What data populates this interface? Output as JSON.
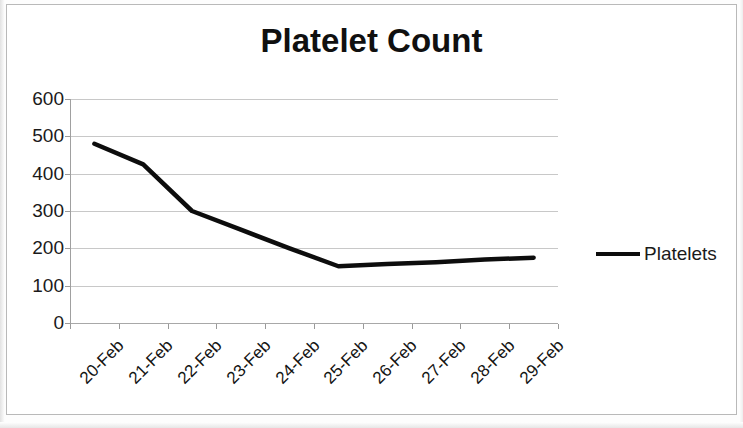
{
  "chart_data": {
    "type": "line",
    "title": "Platelet Count",
    "xlabel": "",
    "ylabel": "",
    "categories": [
      "20-Feb",
      "21-Feb",
      "22-Feb",
      "23-Feb",
      "24-Feb",
      "25-Feb",
      "26-Feb",
      "27-Feb",
      "28-Feb",
      "29-Feb"
    ],
    "series": [
      {
        "name": "Platelets",
        "values": [
          480,
          425,
          300,
          250,
          200,
          152,
          158,
          163,
          170,
          175
        ],
        "color": "#0d0d0d"
      }
    ],
    "ylim": [
      0,
      600
    ],
    "y_ticks": [
      0,
      100,
      200,
      300,
      400,
      500,
      600
    ],
    "y_tick_labels": [
      "0",
      "100",
      "200",
      "300",
      "400",
      "500",
      "600"
    ],
    "grid": true,
    "legend_position": "right",
    "x_tick_label_rotation": -45
  },
  "legend": {
    "entries": [
      {
        "label": "Platelets",
        "swatch": "line-swatch"
      }
    ]
  },
  "colors": {
    "series_line": "#0d0d0d",
    "gridline": "#c8c8c8",
    "axis": "#a0a0a0",
    "text": "#1a1a1a",
    "frame_border": "#b9b9b9",
    "background": "#ffffff"
  }
}
